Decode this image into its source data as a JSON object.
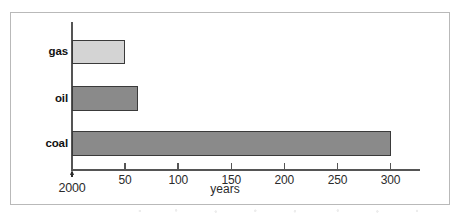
{
  "chart_data": {
    "type": "bar",
    "orientation": "horizontal",
    "title": "",
    "subtitle": "",
    "xlabel": "years",
    "ylabel": "",
    "categories": [
      "gas",
      "oil",
      "coal"
    ],
    "values": [
      50,
      62,
      300
    ],
    "series": [
      {
        "name": "reserves",
        "values": [
          50,
          62,
          300
        ]
      }
    ],
    "bars": [
      {
        "category": "gas",
        "value": 50,
        "fill": "#d4d4d4",
        "stroke": "#3a3a3a"
      },
      {
        "category": "oil",
        "value": 62,
        "fill": "#8a8a8a",
        "stroke": "#3a3a3a"
      },
      {
        "category": "coal",
        "value": 300,
        "fill": "#8a8a8a",
        "stroke": "#3a3a3a"
      }
    ],
    "xlim": [
      0,
      330
    ],
    "ylim": [
      0,
      3
    ],
    "xticks": [
      50,
      100,
      150,
      200,
      250,
      300
    ],
    "xtick_labels": [
      "50",
      "100",
      "150",
      "200",
      "250",
      "300"
    ],
    "origin_label": "2000",
    "origin_marker": "up-arrow",
    "grid": false,
    "legend": null,
    "legend_position": "none",
    "annotations": []
  },
  "axis": {
    "x_title": "years",
    "origin_year": "2000",
    "ticks": [
      {
        "value": 50,
        "label": "50"
      },
      {
        "value": 100,
        "label": "100"
      },
      {
        "value": 150,
        "label": "150"
      },
      {
        "value": 200,
        "label": "200"
      },
      {
        "value": 250,
        "label": "250"
      },
      {
        "value": 300,
        "label": "300"
      }
    ]
  },
  "categories": [
    {
      "label": "gas",
      "value": 50,
      "fill": "#d4d4d4"
    },
    {
      "label": "oil",
      "value": 62,
      "fill": "#8a8a8a"
    },
    {
      "label": "coal",
      "value": 300,
      "fill": "#8a8a8a"
    }
  ],
  "colors": {
    "frame_border": "#b9b9b9",
    "axis": "#555555",
    "bar_stroke": "#3a3a3a",
    "bar_light": "#d4d4d4",
    "bar_dark": "#8a8a8a",
    "text": "#2b2b2b",
    "background": "#ffffff"
  }
}
